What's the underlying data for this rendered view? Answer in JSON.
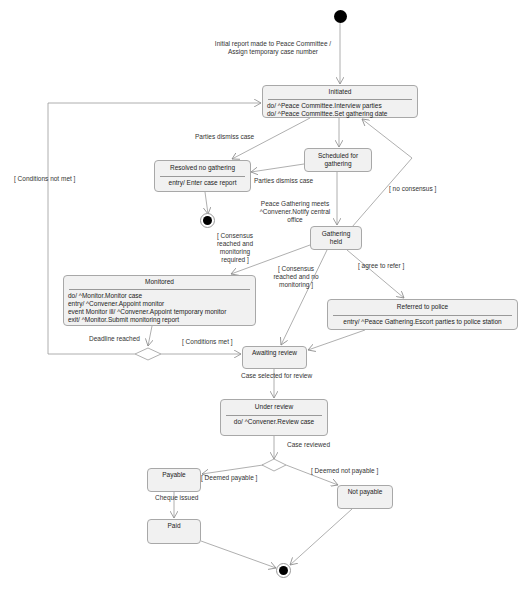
{
  "diagram": {
    "type": "UML state machine",
    "states": {
      "initiated": {
        "name": "Initiated",
        "actions": [
          "do/ ^Peace Committee.Interview parties",
          "do/ ^Peace Committee.Set gathering date"
        ]
      },
      "resolved": {
        "name": "Resolved no gathering",
        "actions": [
          "entry/ Enter case report"
        ]
      },
      "scheduled": {
        "name": "Scheduled for gathering"
      },
      "gathering": {
        "name": "Gathering held"
      },
      "monitored": {
        "name": "Monitored",
        "actions": [
          "do/ ^Monitor.Monitor case",
          "entry/ ^Convener.Appoint monitor",
          "event Monitor ill/ ^Convener.Appoint temporary monitor",
          "exit/ ^Monitor.Submit monitoring report"
        ]
      },
      "referred": {
        "name": "Referred to police",
        "actions": [
          "entry/ ^Peace Gathering.Escort parties to police station"
        ]
      },
      "awaiting": {
        "name": "Awaiting review"
      },
      "under_review": {
        "name": "Under review",
        "actions": [
          "do/ ^Convener.Review case"
        ]
      },
      "payable": {
        "name": "Payable"
      },
      "paid": {
        "name": "Paid"
      },
      "not_payable": {
        "name": "Not payable"
      }
    },
    "transitions": {
      "initial": "Initial report made to Peace Committee / Assign temporary case number",
      "initial_line1": "Initial report made to Peace Committee /",
      "initial_line2": "Assign temporary case number",
      "dismiss1": "Parties dismiss case",
      "dismiss2": "Parties dismiss case",
      "conditions_not_met": "[ Conditions not met ]",
      "gathering_meets_1": "Peace Gathering meets",
      "gathering_meets_2": "^Convener.Notify central",
      "gathering_meets_3": "office",
      "no_consensus": "[ no consensus ]",
      "consensus_monitor_1": "[ Consensus",
      "consensus_monitor_2": "reached and",
      "consensus_monitor_3": "monitoring",
      "consensus_monitor_4": "required ]",
      "consensus_nomonitor_1": "[ Consensus",
      "consensus_nomonitor_2": "reached and no",
      "consensus_nomonitor_3": "monitoring ]",
      "agree_refer": "[ agree to refer ]",
      "deadline": "Deadline reached",
      "conditions_met": "[ Conditions met ]",
      "case_selected": "Case selected for review",
      "case_reviewed": "Case reviewed",
      "deemed_payable": "[ Deemed payable ]",
      "deemed_not_payable": "[ Deemed not payable ]",
      "cheque_issued": "Cheque issued"
    },
    "colors": {
      "state_fill": "#f1f1f1",
      "state_border": "#a8a8a8",
      "edge": "#9a9a9a"
    }
  }
}
